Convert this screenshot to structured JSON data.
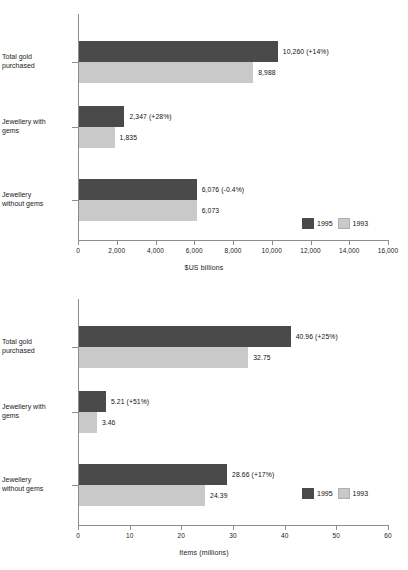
{
  "colors": {
    "series_1995": "#4a4a4a",
    "series_1993": "#c9c9c9",
    "axis": "#8d8d8d",
    "text": "#121212",
    "background": "#ffffff"
  },
  "legend": {
    "entries": [
      {
        "label": "1995",
        "color": "#4a4a4a"
      },
      {
        "label": "1993",
        "color": "#c9c9c9"
      }
    ]
  },
  "chart_data": [
    {
      "id": "chart-value",
      "type": "bar",
      "orientation": "horizontal",
      "title": "",
      "xlabel": "$US billions",
      "ylabel": "",
      "xlim": [
        0,
        16000
      ],
      "xticks": [
        0,
        2000,
        4000,
        6000,
        8000,
        10000,
        12000,
        14000,
        16000
      ],
      "xtick_labels": [
        "0",
        "2,000",
        "4,000",
        "6,000",
        "8,000",
        "10,000",
        "12,000",
        "14,000",
        "16,000"
      ],
      "grid": false,
      "legend_position": "lower-right",
      "categories": [
        "Total gold\npurchased",
        "Jewellery with\ngems",
        "Jewellery\nwithout gems"
      ],
      "series": [
        {
          "name": "1995",
          "color": "#4a4a4a",
          "values": [
            10260,
            2347,
            6076
          ],
          "labels": [
            "10,260 (+14%)",
            "2,347 (+28%)",
            "6,076 (-0.4%)"
          ]
        },
        {
          "name": "1993",
          "color": "#c9c9c9",
          "values": [
            8988,
            1835,
            6073
          ],
          "labels": [
            "8,988",
            "1,835",
            "6,073"
          ]
        }
      ]
    },
    {
      "id": "chart-items",
      "type": "bar",
      "orientation": "horizontal",
      "title": "",
      "xlabel": "Items (millions)",
      "ylabel": "",
      "xlim": [
        0,
        60
      ],
      "xticks": [
        0,
        10,
        20,
        30,
        40,
        50,
        60
      ],
      "xtick_labels": [
        "0",
        "10",
        "20",
        "30",
        "40",
        "50",
        "60"
      ],
      "grid": false,
      "legend_position": "lower-right",
      "categories": [
        "Total gold\npurchased",
        "Jewellery with\ngems",
        "Jewellery\nwithout gems"
      ],
      "series": [
        {
          "name": "1995",
          "color": "#4a4a4a",
          "values": [
            40.96,
            5.21,
            28.66
          ],
          "labels": [
            "40.96 (+25%)",
            "5.21 (+51%)",
            "28.66 (+17%)"
          ]
        },
        {
          "name": "1993",
          "color": "#c9c9c9",
          "values": [
            32.75,
            3.46,
            24.39
          ],
          "labels": [
            "32.75",
            "3.46",
            "24.39"
          ]
        }
      ]
    }
  ]
}
